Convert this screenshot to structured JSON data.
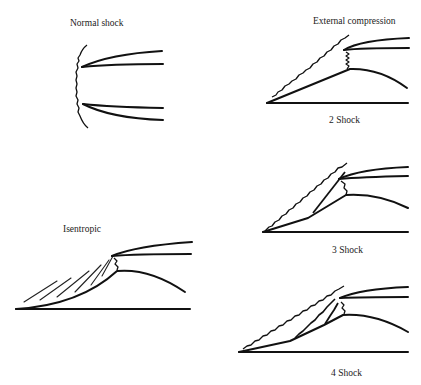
{
  "figure": {
    "panels": [
      {
        "id": "normal",
        "label": "Normal shock"
      },
      {
        "id": "external",
        "label": "External compression"
      },
      {
        "id": "two",
        "label": "2 Shock"
      },
      {
        "id": "three",
        "label": "3 Shock"
      },
      {
        "id": "isentropic",
        "label": "Isentropic"
      },
      {
        "id": "four",
        "label": "4 Shock"
      }
    ]
  }
}
